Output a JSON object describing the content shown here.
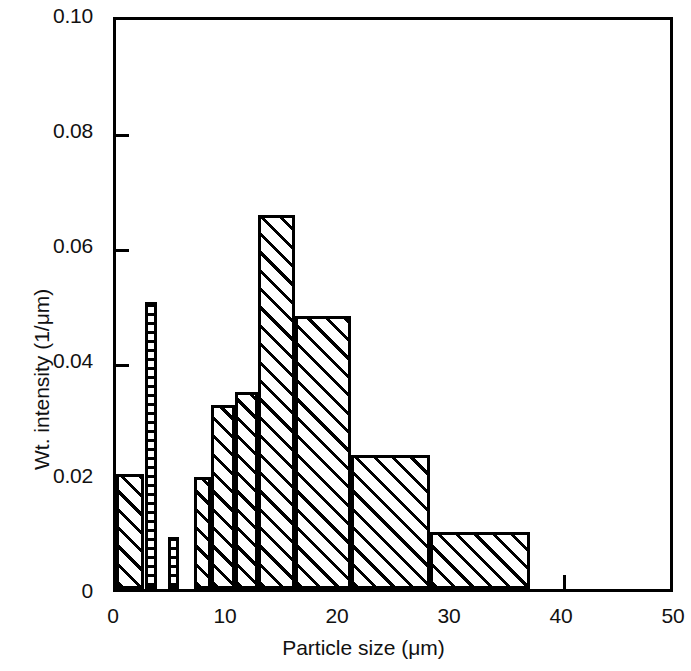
{
  "chart_data": {
    "type": "bar",
    "title": "",
    "subtitle": "",
    "xlabel": "Particle size (μm)",
    "ylabel": "Wt. intensity (1/μm)",
    "xlim": [
      0,
      50
    ],
    "ylim": [
      0,
      0.1
    ],
    "xticks": [
      "0",
      "10",
      "20",
      "30",
      "40",
      "50"
    ],
    "xtick_values": [
      0,
      10,
      20,
      30,
      40,
      50
    ],
    "yticks": [
      "0",
      "0.02",
      "0.04",
      "0.06",
      "0.08",
      "0.10"
    ],
    "ytick_values": [
      0,
      0.02,
      0.04,
      0.06,
      0.08,
      0.1
    ],
    "grid": false,
    "legend": null,
    "bar_style": "hatched-diagonal",
    "categories": [
      "0–2.5",
      "2.5–3.5",
      "4.5–5.5",
      "7–8.5",
      "8.5–10.5",
      "10.5–12.5",
      "13–16",
      "16–21",
      "21–28",
      "28–37"
    ],
    "bins": [
      {
        "x0": 0.0,
        "x1": 2.5,
        "value": 0.02,
        "hatch": "diagonal"
      },
      {
        "x0": 2.6,
        "x1": 3.7,
        "value": 0.05,
        "hatch": "dotted"
      },
      {
        "x0": 4.6,
        "x1": 5.6,
        "value": 0.009,
        "hatch": "dotted"
      },
      {
        "x0": 7.0,
        "x1": 8.5,
        "value": 0.0195,
        "hatch": "diagonal"
      },
      {
        "x0": 8.5,
        "x1": 10.6,
        "value": 0.032,
        "hatch": "diagonal"
      },
      {
        "x0": 10.6,
        "x1": 12.7,
        "value": 0.0343,
        "hatch": "diagonal"
      },
      {
        "x0": 12.7,
        "x1": 16.0,
        "value": 0.065,
        "hatch": "diagonal"
      },
      {
        "x0": 16.0,
        "x1": 21.0,
        "value": 0.0475,
        "hatch": "diagonal"
      },
      {
        "x0": 21.0,
        "x1": 28.0,
        "value": 0.0233,
        "hatch": "diagonal"
      },
      {
        "x0": 28.0,
        "x1": 37.0,
        "value": 0.01,
        "hatch": "diagonal"
      }
    ],
    "values": [
      0.02,
      0.05,
      0.009,
      0.0195,
      0.032,
      0.0343,
      0.065,
      0.0475,
      0.0233,
      0.01
    ]
  },
  "colors": {
    "ink": "#000000",
    "background": "#ffffff"
  }
}
